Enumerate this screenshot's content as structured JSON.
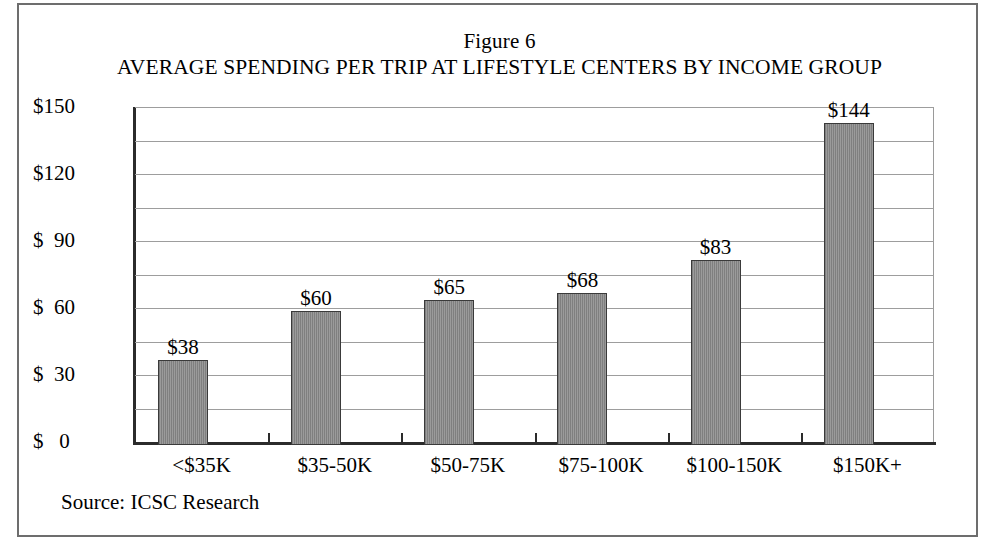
{
  "figure": {
    "number": "Figure 6",
    "title": "AVERAGE SPENDING PER TRIP AT LIFESTYLE CENTERS BY INCOME GROUP",
    "source": "Source: ICSC Research",
    "frame_color": "#6d6d6d",
    "bar_color": "#8d8d8d",
    "bar_border_color": "#3a3a3a",
    "gridline_color": "#9d9d9d",
    "axis_color": "#2b2b2b"
  },
  "chart_data": {
    "type": "bar",
    "title": "AVERAGE SPENDING PER TRIP AT LIFESTYLE CENTERS BY INCOME GROUP",
    "subtitle": "Figure 6",
    "xlabel": "",
    "ylabel": "",
    "categories": [
      "<$35K",
      "$35-50K",
      "$50-75K",
      "$75-100K",
      "$100-150K",
      "$150K+"
    ],
    "values": [
      38,
      60,
      65,
      68,
      83,
      144
    ],
    "data_labels": [
      "$38",
      "$60",
      "$65",
      "$68",
      "$83",
      "$144"
    ],
    "ylim": [
      0,
      150
    ],
    "ytick_values": [
      0,
      30,
      60,
      90,
      120,
      150
    ],
    "ytick_labels": [
      "$   0",
      "$  30",
      "$  60",
      "$  90",
      "$120",
      "$150"
    ],
    "minor_tick_interval": 15,
    "grid": true,
    "legend": "none",
    "annotation": "Source: ICSC Research"
  }
}
